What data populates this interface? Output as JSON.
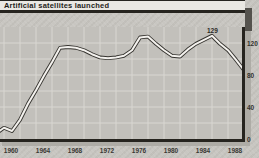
{
  "title": "Artificial satellites launched",
  "annotation": {
    "peak_label": "129"
  },
  "colors": {
    "page_bg": "#c8c6c1",
    "plot_bg": "#c2c0bb",
    "grid": "#d9d7d2",
    "axis": "#26241f",
    "line_outline": "#35332f",
    "line_fill": "#f4f2ee",
    "title_bar_bg": "#eae8e3",
    "shadow": "#aeaca6"
  },
  "chart_data": {
    "type": "line",
    "title": "Artificial satellites launched",
    "x": [
      1957,
      1958,
      1959,
      1960,
      1961,
      1962,
      1963,
      1964,
      1965,
      1966,
      1967,
      1968,
      1969,
      1970,
      1971,
      1972,
      1973,
      1974,
      1975,
      1976,
      1977,
      1978,
      1979,
      1980,
      1981,
      1982,
      1983,
      1984,
      1985,
      1986,
      1987,
      1988
    ],
    "values": [
      7,
      14,
      10,
      24,
      44,
      61,
      79,
      96,
      114,
      115,
      114,
      111,
      106,
      102,
      101,
      102,
      104,
      111,
      127,
      128,
      119,
      111,
      104,
      103,
      112,
      119,
      124,
      129,
      119,
      111,
      99,
      86
    ],
    "xlabel": "",
    "ylabel": "",
    "xlim": [
      1957.5,
      1988
    ],
    "ylim": [
      0,
      140
    ],
    "x_ticks": [
      1960,
      1964,
      1968,
      1972,
      1976,
      1980,
      1984,
      1988
    ],
    "x_tick_labels": [
      "1960",
      "1964",
      "1968",
      "1972",
      "1976",
      "1980",
      "1984",
      "1988"
    ],
    "y_ticks": [
      0,
      40,
      80,
      120
    ],
    "y_tick_labels": [
      "0",
      "40",
      "80",
      "120"
    ],
    "grid": "on (minor gridlines every 2 years and every 20 units)",
    "legend": "none",
    "annotations": [
      {
        "x": 1984,
        "y": 129,
        "text": "129"
      }
    ],
    "style": "white line with dark outline on grey scanned-paper background, y-axis on right side"
  }
}
